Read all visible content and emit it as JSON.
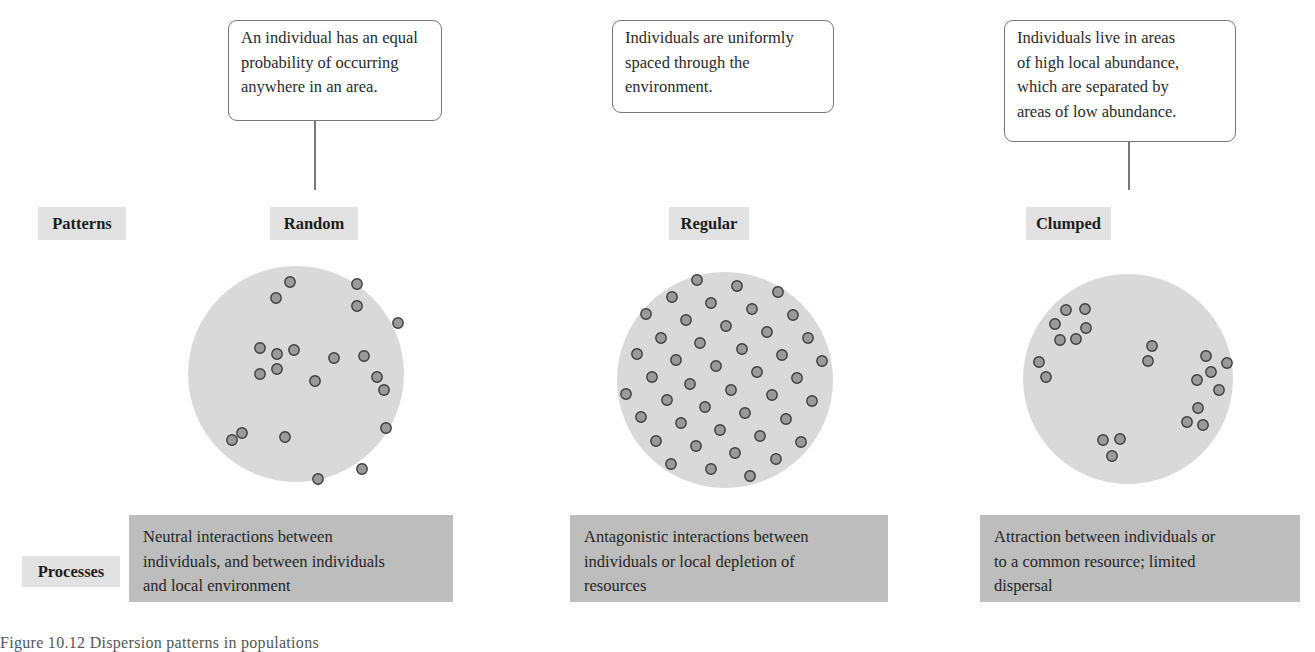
{
  "row_labels": {
    "patterns": "Patterns",
    "processes": "Processes"
  },
  "columns": [
    {
      "pattern": "Random",
      "description": [
        "An individual has an equal",
        "probability of occurring",
        "anywhere in an area."
      ],
      "process": [
        "Neutral interactions between",
        "individuals, and between individuals",
        "and local environment"
      ]
    },
    {
      "pattern": "Regular",
      "description": [
        "Individuals are uniformly",
        "spaced through the",
        "environment."
      ],
      "process": [
        "Antagonistic interactions between",
        "individuals or local depletion of",
        "resources"
      ]
    },
    {
      "pattern": "Clumped",
      "description": [
        "Individuals live in areas",
        "of high local abundance,",
        "which are separated by",
        "areas of low abundance."
      ],
      "process": [
        "Attraction between individuals or",
        "to a common resource; limited",
        "dispersal"
      ]
    }
  ],
  "caption": "Figure 10.12  Dispersion patterns in populations",
  "colors": {
    "plot_fill": "#d9d9d9",
    "dot_fill": "#9a9a9a",
    "dot_stroke": "#3c3c3c",
    "tag_fill": "#e2e2e2",
    "process_fill": "#bdbdbd",
    "callout_border": "#777777"
  },
  "plots": [
    {
      "name": "random",
      "cx": 296,
      "cy": 374,
      "r": 108,
      "dots": [
        [
          290,
          282
        ],
        [
          276,
          298
        ],
        [
          357,
          284
        ],
        [
          357,
          306
        ],
        [
          398,
          323
        ],
        [
          260,
          348
        ],
        [
          277,
          354
        ],
        [
          294,
          350
        ],
        [
          334,
          358
        ],
        [
          364,
          356
        ],
        [
          260,
          374
        ],
        [
          277,
          369
        ],
        [
          315,
          381
        ],
        [
          377,
          377
        ],
        [
          384,
          390
        ],
        [
          386,
          428
        ],
        [
          242,
          433
        ],
        [
          232,
          440
        ],
        [
          285,
          437
        ],
        [
          362,
          469
        ],
        [
          318,
          479
        ]
      ]
    },
    {
      "name": "regular",
      "cx": 725,
      "cy": 380,
      "r": 108,
      "dots": [
        [
          697,
          280
        ],
        [
          737,
          286
        ],
        [
          778,
          292
        ],
        [
          672,
          297
        ],
        [
          711,
          303
        ],
        [
          752,
          309
        ],
        [
          793,
          315
        ],
        [
          646,
          314
        ],
        [
          686,
          320
        ],
        [
          726,
          326
        ],
        [
          767,
          332
        ],
        [
          808,
          338
        ],
        [
          661,
          338
        ],
        [
          700,
          343
        ],
        [
          742,
          349
        ],
        [
          782,
          355
        ],
        [
          822,
          361
        ],
        [
          637,
          354
        ],
        [
          676,
          360
        ],
        [
          716,
          366
        ],
        [
          757,
          372
        ],
        [
          797,
          378
        ],
        [
          652,
          377
        ],
        [
          690,
          384
        ],
        [
          731,
          390
        ],
        [
          772,
          395
        ],
        [
          812,
          401
        ],
        [
          626,
          394
        ],
        [
          667,
          400
        ],
        [
          705,
          407
        ],
        [
          745,
          413
        ],
        [
          786,
          419
        ],
        [
          641,
          417
        ],
        [
          681,
          423
        ],
        [
          720,
          430
        ],
        [
          760,
          436
        ],
        [
          801,
          442
        ],
        [
          656,
          441
        ],
        [
          696,
          446
        ],
        [
          735,
          453
        ],
        [
          776,
          459
        ],
        [
          671,
          464
        ],
        [
          711,
          469
        ],
        [
          750,
          476
        ]
      ]
    },
    {
      "name": "clumped",
      "cx": 1128,
      "cy": 379,
      "r": 105,
      "dots": [
        [
          1066,
          310
        ],
        [
          1085,
          309
        ],
        [
          1055,
          324
        ],
        [
          1086,
          328
        ],
        [
          1060,
          340
        ],
        [
          1076,
          339
        ],
        [
          1152,
          346
        ],
        [
          1148,
          361
        ],
        [
          1039,
          362
        ],
        [
          1046,
          377
        ],
        [
          1206,
          356
        ],
        [
          1227,
          363
        ],
        [
          1211,
          372
        ],
        [
          1197,
          380
        ],
        [
          1219,
          390
        ],
        [
          1198,
          408
        ],
        [
          1187,
          422
        ],
        [
          1203,
          425
        ],
        [
          1103,
          440
        ],
        [
          1120,
          439
        ],
        [
          1112,
          456
        ]
      ]
    }
  ]
}
